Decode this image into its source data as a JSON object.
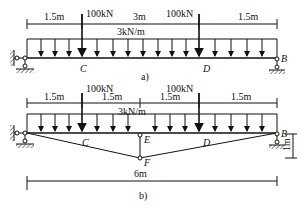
{
  "diagram_a": {
    "caption": "a)",
    "dims": [
      "1.5m",
      "3m",
      "1.5m"
    ],
    "loads": {
      "point_left": "100kN",
      "point_right": "100kN",
      "distributed": "3kN/m"
    },
    "points": {
      "C": "C",
      "D": "D",
      "B": "B"
    }
  },
  "diagram_b": {
    "caption": "b)",
    "dims": [
      "1.5m",
      "1.5m",
      "1.5m",
      "1.5m"
    ],
    "loads": {
      "point_left": "100kN",
      "point_right": "100kN",
      "distributed": "3kN/m"
    },
    "points": {
      "C": "C",
      "D": "D",
      "E": "E",
      "F": "F",
      "B": "B"
    },
    "height": "1m",
    "span": "6m"
  }
}
